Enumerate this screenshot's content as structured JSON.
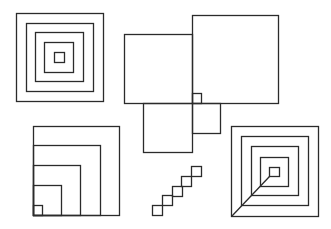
{
  "figure": {
    "background": "#ffffff",
    "stroke": "#2b2b2b",
    "shapes": [
      {
        "name": "concentric-squares",
        "rects": [
          [
            16,
            13,
            87,
            88
          ],
          [
            26,
            23,
            67,
            68
          ],
          [
            35,
            32,
            48,
            49
          ],
          [
            44,
            42,
            29,
            30
          ],
          [
            54,
            52,
            10,
            10
          ]
        ],
        "lines": []
      },
      {
        "name": "overlapping-squares-cluster",
        "rects": [
          [
            192,
            15,
            86,
            88
          ],
          [
            124,
            34,
            68,
            69
          ],
          [
            192,
            93,
            9,
            10
          ],
          [
            143,
            103,
            49,
            49
          ],
          [
            192,
            103,
            28,
            30
          ]
        ],
        "lines": []
      },
      {
        "name": "corner-nested-squares",
        "rects": [
          [
            33,
            126,
            86,
            89
          ],
          [
            33,
            145,
            67,
            70
          ],
          [
            33,
            165,
            47,
            50
          ],
          [
            33,
            185,
            28,
            30
          ],
          [
            33,
            205,
            9,
            10
          ]
        ],
        "lines": []
      },
      {
        "name": "diagonal-staircase-squares",
        "rects": [
          [
            152,
            205,
            10,
            10
          ],
          [
            162,
            195,
            10,
            10
          ],
          [
            172,
            186,
            10,
            10
          ],
          [
            181,
            176,
            10,
            10
          ],
          [
            191,
            166,
            10,
            10
          ]
        ],
        "lines": []
      },
      {
        "name": "concentric-squares-with-diagonal",
        "rects": [
          [
            231,
            126,
            87,
            90
          ],
          [
            241,
            136,
            67,
            69
          ],
          [
            251,
            146,
            47,
            49
          ],
          [
            260,
            157,
            28,
            29
          ],
          [
            269,
            167,
            10,
            9
          ]
        ],
        "lines": [
          [
            231,
            216,
            269,
            176
          ]
        ]
      }
    ]
  }
}
